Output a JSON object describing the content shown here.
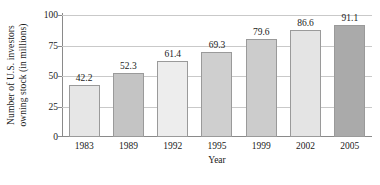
{
  "chart_data": {
    "type": "bar",
    "title": "",
    "xlabel": "Year",
    "ylabel": "Number of U.S. investors owning stock (in millions)",
    "ylabel_line1": "Number of U.S. investors",
    "ylabel_line2": "owning stock (in millions)",
    "categories": [
      "1983",
      "1989",
      "1992",
      "1995",
      "1999",
      "2002",
      "2005"
    ],
    "values": [
      42.2,
      52.3,
      61.4,
      69.3,
      79.6,
      86.6,
      91.1
    ],
    "value_labels": [
      "42.2",
      "52.3",
      "61.4",
      "69.3",
      "79.6",
      "86.6",
      "91.1"
    ],
    "ylim": [
      0,
      100
    ],
    "yticks": [
      100,
      75,
      50,
      25,
      0
    ],
    "ytick_labels": [
      "100",
      "75",
      "50",
      "25",
      "0"
    ],
    "grid": true,
    "legend": "none",
    "bar_colors": [
      "#e6e6e6",
      "#c4c4c4",
      "#ededed",
      "#cfcfcf",
      "#cccccc",
      "#e4e4e4",
      "#aaaaaa"
    ],
    "bar_border_color": "#9a9a9a",
    "axis_color": "#8a8a8a",
    "grid_color": "#c9c9c9",
    "background": "#ffffff"
  }
}
